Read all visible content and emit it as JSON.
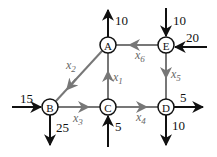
{
  "diagram": {
    "type": "network-flow",
    "nodes": [
      {
        "id": "A",
        "label": "A",
        "x": 108,
        "y": 45
      },
      {
        "id": "E",
        "label": "E",
        "x": 166,
        "y": 45
      },
      {
        "id": "B",
        "label": "B",
        "x": 50,
        "y": 107
      },
      {
        "id": "C",
        "label": "C",
        "x": 108,
        "y": 107
      },
      {
        "id": "D",
        "label": "D",
        "x": 166,
        "y": 107
      }
    ],
    "internal_edges": [
      {
        "from": "C",
        "to": "A",
        "var": "x",
        "sub": "1"
      },
      {
        "from": "A",
        "to": "B",
        "var": "x",
        "sub": "2"
      },
      {
        "from": "B",
        "to": "C",
        "var": "x",
        "sub": "3"
      },
      {
        "from": "C",
        "to": "D",
        "var": "x",
        "sub": "4"
      },
      {
        "from": "E",
        "to": "D",
        "var": "x",
        "sub": "5"
      },
      {
        "from": "E",
        "to": "A",
        "var": "x",
        "sub": "6"
      }
    ],
    "external_flows": [
      {
        "node": "A",
        "direction": "out-up",
        "value": "10"
      },
      {
        "node": "E",
        "direction": "in-from-top",
        "value": "10"
      },
      {
        "node": "E",
        "direction": "in-from-right",
        "value": "20"
      },
      {
        "node": "B",
        "direction": "in-from-left",
        "value": "15"
      },
      {
        "node": "B",
        "direction": "out-down",
        "value": "25"
      },
      {
        "node": "C",
        "direction": "in-from-bottom",
        "value": "5"
      },
      {
        "node": "D",
        "direction": "out-right",
        "value": "5"
      },
      {
        "node": "D",
        "direction": "out-down",
        "value": "10"
      }
    ],
    "colors": {
      "external_arrow": "#111111",
      "internal_edge": "#777777",
      "node_stroke": "#111111"
    }
  }
}
